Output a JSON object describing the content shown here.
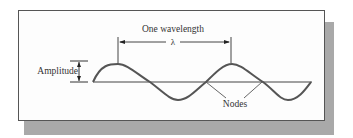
{
  "diagram": {
    "type": "transverse-wave",
    "labels": {
      "wavelength_title": "One wavelength",
      "wavelength_symbol": "λ",
      "amplitude": "Amplitude",
      "nodes": "Nodes"
    },
    "colors": {
      "wave": "#555555",
      "axis": "#444444",
      "text": "#333333",
      "shadow": "#a9a9a9"
    }
  }
}
